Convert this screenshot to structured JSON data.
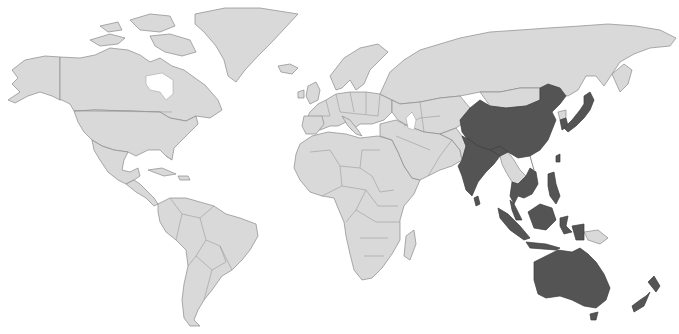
{
  "map": {
    "type": "choropleth-world",
    "projection": "Miller-like",
    "colors": {
      "background": "#ffffff",
      "default_land": "#d9d9d9",
      "highlighted": "#545454",
      "border": "#8a8a8a"
    },
    "highlighted_region": "Asia-Pacific",
    "highlighted_countries": [
      "China",
      "India",
      "Nepal",
      "Bhutan",
      "Bangladesh",
      "Sri Lanka",
      "South Korea",
      "Japan",
      "Taiwan",
      "Thailand",
      "Cambodia",
      "Vietnam",
      "Malaysia",
      "Singapore",
      "Brunei",
      "Indonesia",
      "Philippines",
      "Australia",
      "New Zealand"
    ],
    "non_highlighted_examples": [
      "North America",
      "South America",
      "Europe",
      "Africa",
      "Middle East",
      "Russia",
      "Central Asia",
      "Mongolia",
      "North Korea",
      "Pakistan",
      "Afghanistan",
      "Myanmar",
      "Laos",
      "Papua New Guinea",
      "Greenland"
    ],
    "labels": []
  }
}
